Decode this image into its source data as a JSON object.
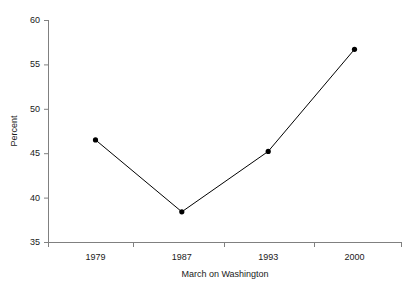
{
  "chart_data": {
    "type": "line",
    "title": "",
    "subtitle": "",
    "xlabel": "March on Washington",
    "ylabel": "Percent",
    "categories": [
      "1979",
      "1987",
      "1993",
      "2000"
    ],
    "values": [
      46.5,
      38.4,
      45.2,
      56.7
    ],
    "series": [
      {
        "name": "Percent",
        "values": [
          46.5,
          38.4,
          45.2,
          56.7
        ]
      }
    ],
    "ylim": [
      35,
      60
    ],
    "yticks": [
      35,
      40,
      45,
      50,
      55,
      60
    ],
    "ytick_labels": [
      "35",
      "40",
      "45",
      "50",
      "55",
      "60"
    ],
    "xtick_labels": [
      "1979",
      "1987",
      "1993",
      "2000"
    ],
    "grid": false,
    "legend": false,
    "legend_position": "none",
    "marker": "filled-circle",
    "line_color": "#000000",
    "marker_color": "#000000",
    "axis_color": "#808080",
    "background_color": "#ffffff"
  }
}
